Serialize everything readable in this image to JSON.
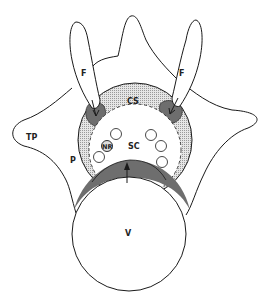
{
  "figure": {
    "labels": {
      "facet_left": "F",
      "facet_right": "F",
      "transverse_process": "TP",
      "pedicle": "P",
      "canal_space": "CS",
      "spinal_cord": "SC",
      "nerve_root": "NR",
      "vertebral_body": "V"
    },
    "colors": {
      "outline": "#1a1a1a",
      "canal_stipple": "#c8c8c8",
      "dark_shading": "#6e6e6e",
      "background": "#ffffff"
    },
    "small_circles_count": 5
  }
}
